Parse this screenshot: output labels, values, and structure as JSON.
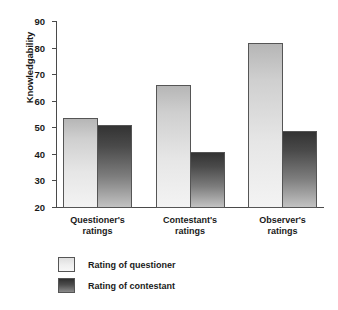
{
  "chart_data": {
    "type": "bar",
    "title": "",
    "xlabel": "",
    "ylabel": "Knowledgability",
    "ylim": [
      20,
      90
    ],
    "yticks": [
      20,
      30,
      40,
      50,
      60,
      70,
      80,
      90
    ],
    "grid": false,
    "legend_position": "bottom-left",
    "categories": [
      "Questioner's\nratings",
      "Contestant's\nratings",
      "Observer's\nratings"
    ],
    "category_lines": [
      [
        "Questioner's",
        "ratings"
      ],
      [
        "Contestant's",
        "ratings"
      ],
      [
        "Observer's",
        "ratings"
      ]
    ],
    "series": [
      {
        "name": "Rating of questioner",
        "color": "#e6e6e6",
        "values": [
          53.6,
          66.0,
          81.9
        ]
      },
      {
        "name": "Rating of contestant",
        "color": "#4a4a4a",
        "values": [
          50.9,
          40.8,
          48.7
        ]
      }
    ]
  },
  "axis": {
    "y_label": "Knowledgability",
    "y_tick_labels": [
      "90",
      "80",
      "70",
      "60",
      "50",
      "40",
      "30",
      "20"
    ]
  },
  "legend": {
    "items": [
      {
        "label": "Rating of questioner",
        "swatch": "light-gradient-swatch"
      },
      {
        "label": "Rating of contestant",
        "swatch": "dark-gradient-swatch"
      }
    ]
  }
}
